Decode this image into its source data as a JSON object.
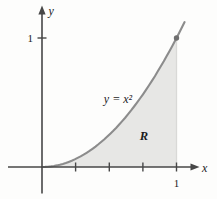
{
  "figure": {
    "colors": {
      "background": "#fdfdfc",
      "axis": "#474747",
      "curve": "#8c8c8c",
      "region_fill": "#e7e7e5",
      "region_edge": "#d9d9d7",
      "point": "#6f6f6f",
      "text": "#1c1c1c"
    },
    "labels": {
      "x_axis": "x",
      "y_axis": "y",
      "curve": "y = x²",
      "region": "R",
      "x_tick_1": "1",
      "y_tick_1": "1"
    }
  },
  "chart_data": {
    "type": "line",
    "xlabel": "x",
    "ylabel": "y",
    "xlim": [
      -0.25,
      1.17
    ],
    "ylim": [
      -0.21,
      1.26
    ],
    "grid": false,
    "x_ticks": [
      0.25,
      0.5,
      0.75,
      1
    ],
    "x_tick_labels": [
      "",
      "",
      "",
      "1"
    ],
    "y_ticks": [
      1
    ],
    "y_tick_labels": [
      "1"
    ],
    "series": [
      {
        "name": "y = x²",
        "function": "y = x^2",
        "power": 2,
        "x_start": 0,
        "x_end": 1.06
      }
    ],
    "shaded_region": {
      "label": "R",
      "between": "curve y = x² and x-axis",
      "from_x": 0,
      "to_x": 1
    },
    "marked_point": {
      "x": 1,
      "y": 1
    }
  }
}
